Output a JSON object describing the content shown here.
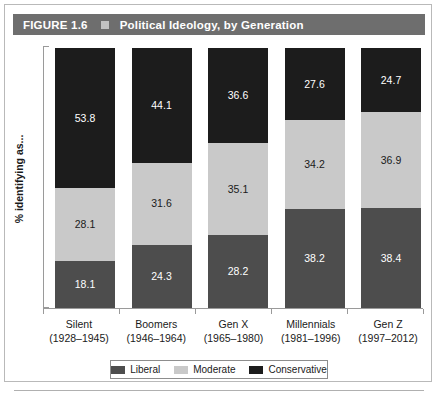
{
  "figure": {
    "number_label": "FIGURE 1.6",
    "separator_icon": "square-bullet-icon",
    "title": "Political Ideology, by Generation"
  },
  "axes": {
    "y_label": "% identifying as...",
    "x_label": ""
  },
  "legend": {
    "position": "bottom",
    "items": [
      {
        "label": "Liberal",
        "color": "#4d4d4d"
      },
      {
        "label": "Moderate",
        "color": "#c9c9c9"
      },
      {
        "label": "Conservative",
        "color": "#1c1c1c"
      }
    ]
  },
  "colors": {
    "liberal": "#4d4d4d",
    "moderate": "#c9c9c9",
    "conservative": "#1c1c1c",
    "header_bar": "#6e6e6e",
    "frame_border": "#b9b9b9",
    "axis_line": "#9a9a9a"
  },
  "categories": [
    {
      "name": "Silent",
      "years": "(1928–1945)"
    },
    {
      "name": "Boomers",
      "years": "(1946–1964)"
    },
    {
      "name": "Gen X",
      "years": "(1965–1980)"
    },
    {
      "name": "Millennials",
      "years": "(1981–1996)"
    },
    {
      "name": "Gen Z",
      "years": "(1997–2012)"
    }
  ],
  "chart_data": {
    "type": "bar",
    "stacked": true,
    "stack_mode": "percent",
    "orientation": "vertical",
    "title": "Political Ideology, by Generation",
    "xlabel": "",
    "ylabel": "% identifying as...",
    "ylim": [
      0,
      100
    ],
    "grid": false,
    "legend_position": "bottom",
    "categories": [
      "Silent",
      "Boomers",
      "Gen X",
      "Millennials",
      "Gen Z"
    ],
    "category_sublabels": [
      "(1928–1945)",
      "(1946–1964)",
      "(1965–1980)",
      "(1981–1996)",
      "(1997–2012)"
    ],
    "series": [
      {
        "name": "Liberal",
        "color": "#4d4d4d",
        "values": [
          18.1,
          24.3,
          28.2,
          38.2,
          38.4
        ]
      },
      {
        "name": "Moderate",
        "color": "#c9c9c9",
        "values": [
          28.1,
          31.6,
          35.1,
          34.2,
          36.9
        ]
      },
      {
        "name": "Conservative",
        "color": "#1c1c1c",
        "values": [
          53.8,
          44.1,
          36.6,
          27.6,
          24.7
        ]
      }
    ],
    "data_labels": {
      "Silent": {
        "Liberal": "18.1",
        "Moderate": "28.1",
        "Conservative": "53.8"
      },
      "Boomers": {
        "Liberal": "24.3",
        "Moderate": "31.6",
        "Conservative": "44.1"
      },
      "Gen X": {
        "Liberal": "28.2",
        "Moderate": "35.1",
        "Conservative": "36.6"
      },
      "Millennials": {
        "Liberal": "38.2",
        "Moderate": "34.2",
        "Conservative": "27.6"
      },
      "Gen Z": {
        "Liberal": "38.4",
        "Moderate": "36.9",
        "Conservative": "24.7"
      }
    }
  }
}
